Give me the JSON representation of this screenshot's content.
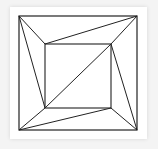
{
  "diagram": {
    "stroke_color": "#222222",
    "outer_square": {
      "x1": 19,
      "y1": 16,
      "x2": 137,
      "y2": 130
    },
    "inner_square": {
      "x1": 45,
      "y1": 44,
      "x2": 111,
      "y2": 108
    },
    "lines": [
      {
        "from": [
          19,
          16
        ],
        "to": [
          45,
          44
        ]
      },
      {
        "from": [
          19,
          16
        ],
        "to": [
          45,
          108
        ]
      },
      {
        "from": [
          137,
          16
        ],
        "to": [
          45,
          44
        ]
      },
      {
        "from": [
          137,
          16
        ],
        "to": [
          111,
          44
        ]
      },
      {
        "from": [
          137,
          130
        ],
        "to": [
          111,
          44
        ]
      },
      {
        "from": [
          137,
          130
        ],
        "to": [
          111,
          108
        ]
      },
      {
        "from": [
          19,
          130
        ],
        "to": [
          45,
          108
        ]
      },
      {
        "from": [
          19,
          130
        ],
        "to": [
          111,
          108
        ]
      },
      {
        "from": [
          45,
          108
        ],
        "to": [
          111,
          44
        ]
      }
    ]
  }
}
